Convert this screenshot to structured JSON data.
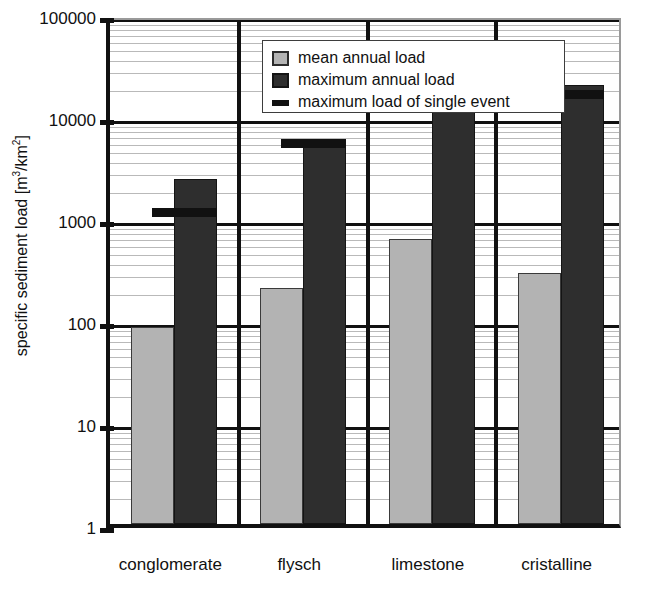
{
  "chart_data": {
    "type": "bar",
    "title": "",
    "xlabel": "",
    "ylabel": "specific sediment load [m3/km2]",
    "ylabel_parts": {
      "prefix": "specific sediment load [m",
      "sup1": "3",
      "mid": "/km",
      "sup2": "2",
      "suffix": "]"
    },
    "yscale": "log",
    "ylim": [
      1,
      100000
    ],
    "ytick_labels": [
      "100000",
      "10000",
      "1000",
      "100",
      "10",
      "1"
    ],
    "ytick_values": [
      100000,
      10000,
      1000,
      100,
      10,
      1
    ],
    "grid": "log-minor-horizontal",
    "legend_position": "top-left-inside",
    "categories": [
      "conglomerate",
      "flysch",
      "limestone",
      "cristalline"
    ],
    "series": [
      {
        "name": "mean annual load",
        "key": "mean",
        "color": "#b3b3b3",
        "values": [
          85,
          205,
          620,
          290
        ]
      },
      {
        "name": "maximum annual load",
        "key": "max",
        "color": "#2e2e2e",
        "values": [
          2400,
          5800,
          21500,
          20000
        ]
      },
      {
        "name": "maximum load of single event",
        "key": "event",
        "color": "#111111",
        "marker": "thick-horizontal-line",
        "values": [
          1300,
          6100,
          13500,
          18800
        ]
      }
    ]
  },
  "legend": {
    "items": [
      {
        "label": "mean annual load",
        "key": "mean"
      },
      {
        "label": "maximum annual load",
        "key": "max"
      },
      {
        "label": "maximum load of single event",
        "key": "event"
      }
    ]
  }
}
